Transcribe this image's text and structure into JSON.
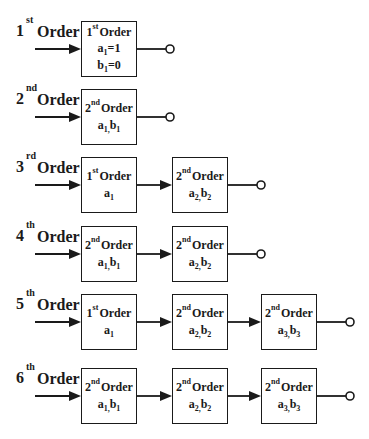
{
  "diagram": {
    "colors": {
      "line": "#1a1a1a",
      "background": "#ffffff"
    },
    "rows": [
      {
        "order_num": "1",
        "order_sup": "st",
        "order_word": "Order",
        "top": 21,
        "blocks": [
          {
            "num": "1",
            "sup": "st",
            "word": "Order",
            "params": [
              {
                "text": "a",
                "sub": "1",
                "tail": "=1"
              },
              {
                "text": "b",
                "sub": "1",
                "tail": "=0"
              }
            ]
          }
        ]
      },
      {
        "order_num": "2",
        "order_sup": "nd",
        "order_word": "Order",
        "top": 89,
        "blocks": [
          {
            "num": "2",
            "sup": "nd",
            "word": "Order",
            "params": [
              {
                "text": "a",
                "sub": "1,",
                "tail": "",
                "text2": "b",
                "sub2": "1"
              }
            ]
          }
        ]
      },
      {
        "order_num": "3",
        "order_sup": "rd",
        "order_word": "Order",
        "top": 157,
        "blocks": [
          {
            "num": "1",
            "sup": "st",
            "word": "Order",
            "params": [
              {
                "text": "a",
                "sub": "1"
              }
            ]
          },
          {
            "num": "2",
            "sup": "nd",
            "word": "Order",
            "params": [
              {
                "text": "a",
                "sub": "2,",
                "text2": "b",
                "sub2": "2"
              }
            ]
          }
        ]
      },
      {
        "order_num": "4",
        "order_sup": "th",
        "order_word": "Order",
        "top": 226,
        "blocks": [
          {
            "num": "2",
            "sup": "nd",
            "word": "Order",
            "params": [
              {
                "text": "a",
                "sub": "1,",
                "text2": "b",
                "sub2": "1"
              }
            ]
          },
          {
            "num": "2",
            "sup": "nd",
            "word": "Order",
            "params": [
              {
                "text": "a",
                "sub": "2,",
                "text2": "b",
                "sub2": "2"
              }
            ]
          }
        ]
      },
      {
        "order_num": "5",
        "order_sup": "th",
        "order_word": "Order",
        "top": 294,
        "blocks": [
          {
            "num": "1",
            "sup": "st",
            "word": "Order",
            "params": [
              {
                "text": "a",
                "sub": "1"
              }
            ]
          },
          {
            "num": "2",
            "sup": "nd",
            "word": "Order",
            "params": [
              {
                "text": "a",
                "sub": "2,",
                "text2": "b",
                "sub2": "2"
              }
            ]
          },
          {
            "num": "2",
            "sup": "nd",
            "word": "Order",
            "params": [
              {
                "text": "a",
                "sub": "3,",
                "text2": "b",
                "sub2": "3"
              }
            ]
          }
        ]
      },
      {
        "order_num": "6",
        "order_sup": "th",
        "order_word": "Order",
        "top": 368,
        "blocks": [
          {
            "num": "2",
            "sup": "nd",
            "word": "Order",
            "params": [
              {
                "text": "a",
                "sub": "1,",
                "text2": "b",
                "sub2": "1"
              }
            ]
          },
          {
            "num": "2",
            "sup": "nd",
            "word": "Order",
            "params": [
              {
                "text": "a",
                "sub": "2,",
                "text2": "b",
                "sub2": "2"
              }
            ]
          },
          {
            "num": "2",
            "sup": "nd",
            "word": "Order",
            "params": [
              {
                "text": "a",
                "sub": "3,",
                "text2": "b",
                "sub2": "3"
              }
            ]
          }
        ]
      }
    ]
  }
}
